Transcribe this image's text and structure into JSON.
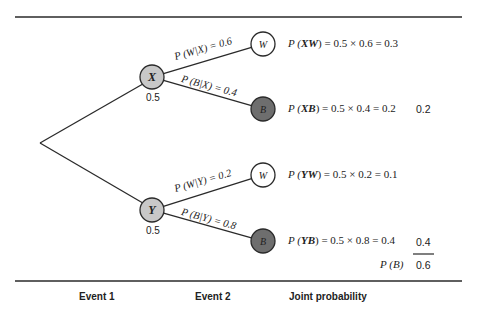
{
  "colors": {
    "line": "#2a2a2a",
    "node_first": "#c8c8c8",
    "node_white": "#ffffff",
    "node_black": "#6e6e6e"
  },
  "tree": {
    "root": {
      "x": 40,
      "y": 143
    },
    "first_level": [
      {
        "id": "X",
        "label": "X",
        "prob": "0.5",
        "x": 152,
        "y": 77,
        "branches": [
          {
            "to": "W",
            "label": "P (W|X) = 0.6",
            "x": 263,
            "y": 44,
            "kind": "white"
          },
          {
            "to": "B",
            "label": "P (B|X) = 0.4",
            "x": 263,
            "y": 109,
            "kind": "black"
          }
        ]
      },
      {
        "id": "Y",
        "label": "Y",
        "prob": "0.5",
        "x": 152,
        "y": 210,
        "branches": [
          {
            "to": "W",
            "label": "P (W|Y) = 0.2",
            "x": 263,
            "y": 175,
            "kind": "white"
          },
          {
            "to": "B",
            "label": "P (B|Y) = 0.8",
            "x": 263,
            "y": 241,
            "kind": "black"
          }
        ]
      }
    ]
  },
  "joint": [
    {
      "prefix": "P (",
      "event": "XW",
      "suffix": ") = 0.5 × 0.6 = 0.3",
      "side": ""
    },
    {
      "prefix": "P (",
      "event": "XB",
      "suffix": ") = 0.5 × 0.4 = 0.2",
      "side": "0.2"
    },
    {
      "prefix": "P (",
      "event": "YW",
      "suffix": ") = 0.5 × 0.2 = 0.1",
      "side": ""
    },
    {
      "prefix": "P (",
      "event": "YB",
      "suffix": ") = 0.5 × 0.8 = 0.4",
      "side": "0.4"
    }
  ],
  "total": {
    "label": "P (B)",
    "value": "0.6"
  },
  "footer": {
    "event1": "Event 1",
    "event2": "Event 2",
    "joint": "Joint probability"
  }
}
